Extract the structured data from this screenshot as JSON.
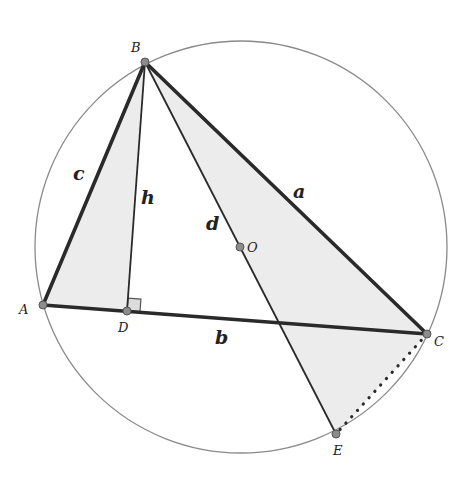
{
  "diagram": {
    "type": "geometry",
    "circle": {
      "center": "O",
      "cx": 241,
      "cy": 247,
      "r": 206
    },
    "points": [
      {
        "id": "A",
        "label": "A",
        "x": 43,
        "y": 305,
        "lx": 19,
        "ly": 314
      },
      {
        "id": "B",
        "label": "B",
        "x": 145,
        "y": 62,
        "lx": 131,
        "ly": 52
      },
      {
        "id": "C",
        "label": "C",
        "x": 427,
        "y": 334,
        "lx": 434,
        "ly": 346
      },
      {
        "id": "D",
        "label": "D",
        "x": 127,
        "y": 311,
        "lx": 118,
        "ly": 332
      },
      {
        "id": "E",
        "label": "E",
        "x": 336,
        "y": 434,
        "lx": 333,
        "ly": 455
      },
      {
        "id": "O",
        "label": "O",
        "x": 240,
        "y": 247,
        "lx": 247,
        "ly": 252
      }
    ],
    "segments": [
      {
        "from": "A",
        "to": "B",
        "label": "c",
        "style": "thick"
      },
      {
        "from": "B",
        "to": "C",
        "label": "a",
        "style": "thick"
      },
      {
        "from": "A",
        "to": "C",
        "label": "b",
        "style": "thick"
      },
      {
        "from": "B",
        "to": "D",
        "label": "h",
        "style": "thin"
      },
      {
        "from": "B",
        "to": "E",
        "label": "d",
        "style": "thin"
      },
      {
        "from": "C",
        "to": "E",
        "label": "",
        "style": "dotted"
      }
    ],
    "segment_labels": [
      {
        "text": "c",
        "x": 73,
        "y": 180
      },
      {
        "text": "h",
        "x": 141,
        "y": 204
      },
      {
        "text": "d",
        "x": 206,
        "y": 230
      },
      {
        "text": "a",
        "x": 293,
        "y": 198
      },
      {
        "text": "b",
        "x": 215,
        "y": 344
      }
    ],
    "shaded_regions": [
      {
        "vertices": [
          "A",
          "B",
          "D"
        ]
      },
      {
        "vertices": [
          "B",
          "C",
          "E"
        ]
      }
    ],
    "right_angle_marker": {
      "at": "D"
    },
    "colors": {
      "stroke": "#2a2a2a",
      "circle": "#8a8a8a",
      "shade": "#ececec",
      "point_fill": "#8c8c8c"
    }
  }
}
